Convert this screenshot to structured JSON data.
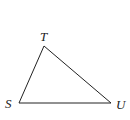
{
  "diagram": {
    "type": "triangle",
    "stroke_color": "#222222",
    "vertices": [
      {
        "label": "T",
        "x": 44,
        "y": 46
      },
      {
        "label": "S",
        "x": 19,
        "y": 103
      },
      {
        "label": "U",
        "x": 111,
        "y": 103
      }
    ],
    "labels": {
      "T": "T",
      "S": "S",
      "U": "U"
    }
  }
}
